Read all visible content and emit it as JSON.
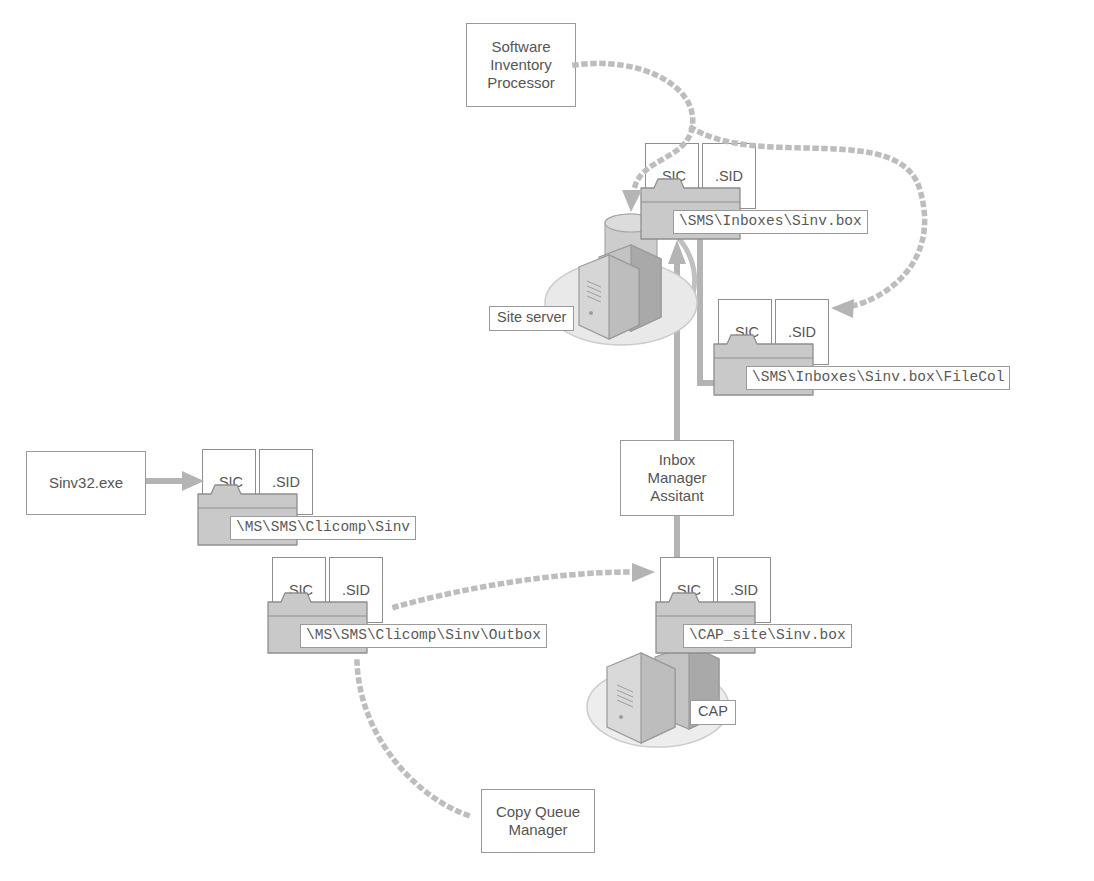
{
  "diagram": {
    "colors": {
      "folder_fill": "#c9c9c9",
      "folder_stroke": "#8f8f8f",
      "line_gray": "#b4b4b4",
      "dot_gray": "#bdbdbd",
      "text_gray": "#555555",
      "box_stroke": "#9a9a9a",
      "background": "#ffffff"
    },
    "processes": [
      {
        "id": "sip",
        "label": "Software\nInventory\nProcessor"
      },
      {
        "id": "sinv32",
        "label": "Sinv32.exe"
      },
      {
        "id": "ima",
        "label": "Inbox\nManager\nAssitant"
      },
      {
        "id": "cqm",
        "label": "Copy Queue\nManager"
      }
    ],
    "machines": [
      {
        "id": "site-server",
        "label": "Site server"
      },
      {
        "id": "cap",
        "label": "CAP"
      }
    ],
    "file_types": {
      "sic": ".SIC",
      "sid": ".SID"
    },
    "folders": [
      {
        "id": "sinv-box",
        "path": "\\SMS\\Inboxes\\Sinv.box"
      },
      {
        "id": "sinv-box-filecol",
        "path": "\\SMS\\Inboxes\\Sinv.box\\FileCol"
      },
      {
        "id": "clicomp-sinv",
        "path": "\\MS\\SMS\\Clicomp\\Sinv"
      },
      {
        "id": "clicomp-outbox",
        "path": "\\MS\\SMS\\Clicomp\\Sinv\\Outbox"
      },
      {
        "id": "cap-sinv-box",
        "path": "\\CAP_site\\Sinv.box"
      }
    ]
  }
}
